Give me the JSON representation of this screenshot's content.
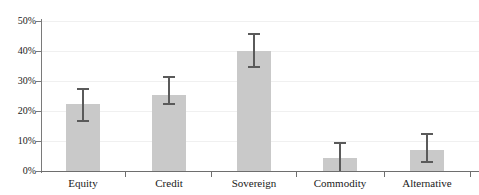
{
  "chart_data": {
    "type": "bar",
    "title": "",
    "xlabel": "",
    "ylabel": "",
    "categories": [
      "Equity",
      "Credit",
      "Sovereign",
      "Commodity",
      "Alternative"
    ],
    "values": [
      22.5,
      25.5,
      40.0,
      4.5,
      7.0
    ],
    "error_low": [
      16.8,
      22.3,
      34.8,
      0.0,
      3.0
    ],
    "error_high": [
      27.5,
      31.5,
      45.7,
      9.2,
      12.2
    ],
    "ylim": [
      0,
      50
    ],
    "yticks": [
      0,
      10,
      20,
      30,
      40,
      50
    ],
    "ytick_labels": [
      "0%",
      "10%",
      "20%",
      "30%",
      "40%",
      "50%"
    ],
    "grid": true,
    "legend": "none",
    "units": "percent",
    "bar_color": "#c9c9c9",
    "error_color": "#5a5a5a",
    "axis_color": "#6e6e6e",
    "grid_color": "#f0f0f0"
  },
  "axis": {
    "y_labels": [
      "50%",
      "40%",
      "30%",
      "20%",
      "10%",
      "0%"
    ],
    "x_labels": [
      "Equity",
      "Credit",
      "Sovereign",
      "Commodity",
      "Alternative"
    ]
  }
}
